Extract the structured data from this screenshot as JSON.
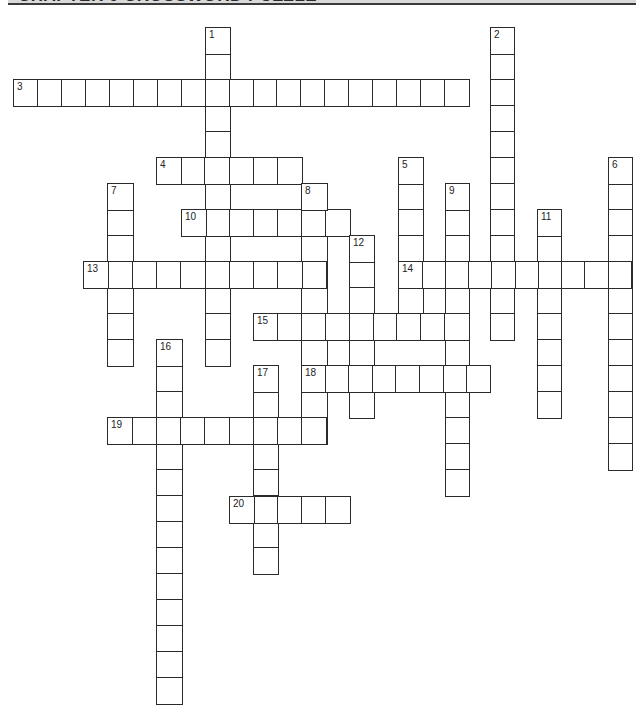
{
  "header": {
    "title": "CHAPTER 9 CROSSWORD PUZZLE"
  },
  "puzzle": {
    "cell_height": 26,
    "words": [
      {
        "number": "1",
        "direction": "down",
        "length": 13,
        "x": 205,
        "y": 27,
        "w": 24
      },
      {
        "number": "2",
        "direction": "down",
        "length": 12,
        "x": 490,
        "y": 27,
        "w": 23
      },
      {
        "number": "3",
        "direction": "across",
        "length": 19,
        "x": 13,
        "y": 79,
        "w": 23.95
      },
      {
        "number": "4",
        "direction": "across",
        "length": 6,
        "x": 156,
        "y": 157,
        "w": 24.2
      },
      {
        "number": "5",
        "direction": "down",
        "length": 7,
        "x": 398,
        "y": 157,
        "w": 24
      },
      {
        "number": "6",
        "direction": "down",
        "length": 12,
        "x": 608,
        "y": 157,
        "w": 23
      },
      {
        "number": "7",
        "direction": "down",
        "length": 7,
        "x": 107,
        "y": 183,
        "w": 25
      },
      {
        "number": "8",
        "direction": "down",
        "length": 10,
        "x": 301,
        "y": 183,
        "w": 25
      },
      {
        "number": "9",
        "direction": "down",
        "length": 12,
        "x": 445,
        "y": 183,
        "w": 23
      },
      {
        "number": "10",
        "direction": "across",
        "length": 7,
        "x": 181,
        "y": 209,
        "w": 24
      },
      {
        "number": "11",
        "direction": "down",
        "length": 8,
        "x": 537,
        "y": 209,
        "w": 23
      },
      {
        "number": "12",
        "direction": "down",
        "length": 7,
        "x": 349,
        "y": 235,
        "w": 24
      },
      {
        "number": "13",
        "direction": "across",
        "length": 10,
        "x": 83,
        "y": 261,
        "w": 24.3
      },
      {
        "number": "14",
        "direction": "across",
        "length": 10,
        "x": 398,
        "y": 261,
        "w": 23.3
      },
      {
        "number": "15",
        "direction": "across",
        "length": 9,
        "x": 253,
        "y": 313,
        "w": 23.9
      },
      {
        "number": "16",
        "direction": "down",
        "length": 14,
        "x": 156,
        "y": 339,
        "w": 25
      },
      {
        "number": "17",
        "direction": "down",
        "length": 8,
        "x": 253,
        "y": 365,
        "w": 24
      },
      {
        "number": "18",
        "direction": "across",
        "length": 8,
        "x": 301,
        "y": 365,
        "w": 23.6
      },
      {
        "number": "19",
        "direction": "across",
        "length": 9,
        "x": 107,
        "y": 417,
        "w": 24.3
      },
      {
        "number": "20",
        "direction": "across",
        "length": 5,
        "x": 229,
        "y": 496,
        "w": 24
      }
    ]
  }
}
